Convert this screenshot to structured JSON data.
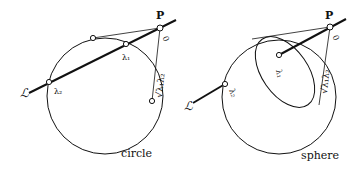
{
  "figures": [
    {
      "caption": "circle",
      "labels": {
        "point": "P",
        "origin": "0",
        "line": "ℒ",
        "lambda1": "λ₁",
        "lambda2": "λ₂",
        "tangent_length": "√λ₁λ₂"
      }
    },
    {
      "caption": "sphere",
      "labels": {
        "point": "P",
        "origin": "0",
        "line": "ℒ",
        "lambda1": "λ₁",
        "lambda2": "λ₂",
        "tangent_length": "√λ₁λ₂"
      }
    }
  ]
}
